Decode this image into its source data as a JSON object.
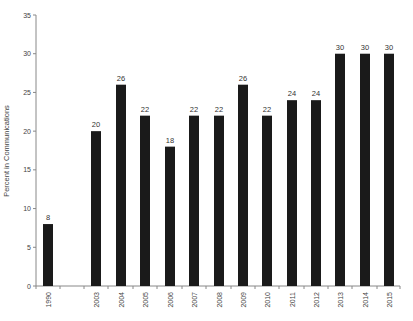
{
  "chart_data": {
    "type": "bar",
    "title": "",
    "xlabel": "",
    "ylabel": "Percent in Communications",
    "ylim": [
      0,
      35
    ],
    "yticks": [
      0,
      5,
      10,
      15,
      20,
      25,
      30,
      35
    ],
    "grid": false,
    "legend": null,
    "bar_color": "#1a1a1a",
    "categories": [
      "1990",
      "2003",
      "2004",
      "2005",
      "2006",
      "2007",
      "2008",
      "2009",
      "2010",
      "2011",
      "2012",
      "2013",
      "2014",
      "2015"
    ],
    "values": [
      8,
      20,
      26,
      22,
      18,
      22,
      22,
      26,
      22,
      24,
      24,
      30,
      30,
      30
    ],
    "data_labels": [
      "8",
      "20",
      "26",
      "22",
      "18",
      "22",
      "22",
      "26",
      "22",
      "24",
      "24",
      "30",
      "30",
      "30"
    ],
    "x_positions": [
      48,
      96,
      121,
      145,
      170,
      194,
      219,
      243,
      267,
      292,
      316,
      340,
      365,
      389
    ]
  }
}
